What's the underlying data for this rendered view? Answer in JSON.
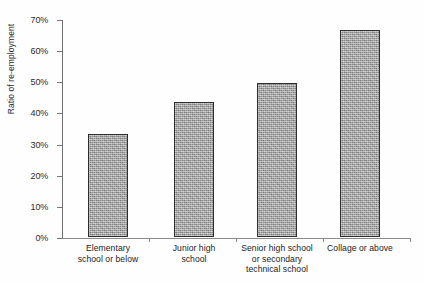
{
  "chart_data": {
    "type": "bar",
    "title": "",
    "xlabel": "",
    "ylabel": "Ratio of re-employment",
    "categories": [
      "Elementary school or below",
      "Junior high school",
      "Senior high school or secondary technical school",
      "Collage or above"
    ],
    "category_lines": [
      [
        "Elementary",
        "school or below"
      ],
      [
        "Junior high",
        "school"
      ],
      [
        "Senior high school",
        "or secondary",
        "technical school"
      ],
      [
        "Collage or above"
      ]
    ],
    "values": [
      33,
      43.5,
      49.5,
      66.5
    ],
    "value_labels": [
      "33%",
      "43.5%",
      "49.5%",
      "66.5%"
    ],
    "ylim": [
      0,
      70
    ],
    "ytick_values": [
      0,
      10,
      20,
      30,
      40,
      50,
      60,
      70
    ],
    "ytick_labels": [
      "0%",
      "10%",
      "20%",
      "30%",
      "40%",
      "50%",
      "60%",
      "70%"
    ],
    "grid": false,
    "legend": false,
    "legend_position": "none",
    "bar_fill_color": "#a9a9a9",
    "bar_border_color": "#2e2e2e",
    "axis_color": "#7a7a7a",
    "background_color": "#fefefe"
  }
}
